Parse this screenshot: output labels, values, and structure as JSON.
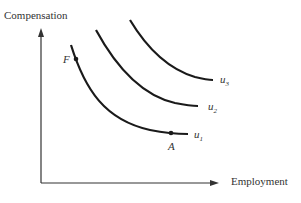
{
  "diagram": {
    "y_axis_label": "Compensation",
    "x_axis_label": "Employment",
    "curves": [
      {
        "id": "u1",
        "label": "u",
        "sub": "1"
      },
      {
        "id": "u2",
        "label": "u",
        "sub": "2"
      },
      {
        "id": "u3",
        "label": "u",
        "sub": "3"
      }
    ],
    "points": [
      {
        "id": "F",
        "label": "F"
      },
      {
        "id": "A",
        "label": "A"
      }
    ],
    "colors": {
      "line": "#1a1a1a",
      "text": "#333333"
    }
  }
}
